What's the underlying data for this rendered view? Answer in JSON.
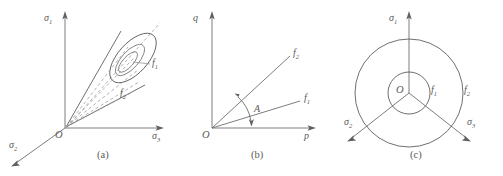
{
  "figure": {
    "type": "line-diagram",
    "panel_count": 3,
    "background_color": "#ffffff",
    "line_color": "#6e6e6e",
    "text_color": "#5a5a5a"
  },
  "panel_a": {
    "caption": "(a)",
    "origin_label": "O",
    "axes": [
      {
        "name": "sigma-1-axis",
        "symbol": "σ",
        "subscript": "1",
        "direction": "up"
      },
      {
        "name": "sigma-2-axis",
        "symbol": "σ",
        "subscript": "2",
        "direction": "down-left"
      },
      {
        "name": "sigma-3-axis",
        "symbol": "σ",
        "subscript": "3",
        "direction": "right"
      }
    ],
    "surfaces": [
      {
        "name": "inner-cone-surface",
        "symbol": "f",
        "subscript": "1"
      },
      {
        "name": "outer-cone-surface",
        "symbol": "f",
        "subscript": "2"
      }
    ],
    "description": "Conical yield surfaces in principal stress space with elliptical cross-section and dashed hydrostatic axis"
  },
  "panel_b": {
    "caption": "(b)",
    "origin_label": "O",
    "axes": [
      {
        "name": "q-axis",
        "symbol": "q",
        "subscript": "",
        "direction": "up"
      },
      {
        "name": "p-axis",
        "symbol": "p",
        "subscript": "",
        "direction": "right"
      }
    ],
    "lines": [
      {
        "name": "f1-line",
        "symbol": "f",
        "subscript": "1"
      },
      {
        "name": "f2-line",
        "symbol": "f",
        "subscript": "2"
      }
    ],
    "angle_label": "A",
    "description": "p-q plane showing two straight yield loci separated by angle A"
  },
  "panel_c": {
    "caption": "(c)",
    "origin_label": "O",
    "axes": [
      {
        "name": "sigma-1-axis",
        "symbol": "σ",
        "subscript": "1",
        "direction": "up"
      },
      {
        "name": "sigma-2-axis",
        "symbol": "σ",
        "subscript": "2",
        "direction": "down-left"
      },
      {
        "name": "sigma-3-axis",
        "symbol": "σ",
        "subscript": "3",
        "direction": "down-right"
      }
    ],
    "curves": [
      {
        "name": "inner-circle",
        "symbol": "f",
        "subscript": "1"
      },
      {
        "name": "outer-circle",
        "symbol": "f",
        "subscript": "2"
      }
    ],
    "description": "Deviatoric plane view with two concentric circular yield loci"
  }
}
